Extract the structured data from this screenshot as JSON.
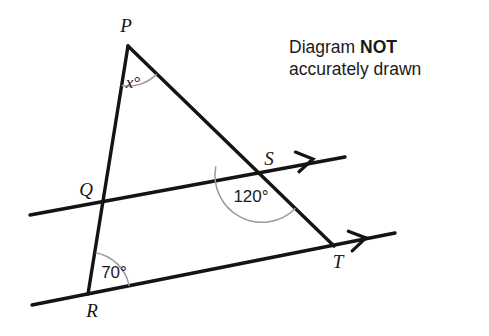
{
  "figure": {
    "type": "geometry-diagram",
    "note": {
      "line1_prefix": "Diagram ",
      "line1_emphasis": "NOT",
      "line2": "accurately drawn"
    },
    "vertices": [
      {
        "id": "P",
        "label": "P",
        "x": 128,
        "y": 46,
        "label_x": 126,
        "label_y": 32
      },
      {
        "id": "Q",
        "label": "Q",
        "x": 101,
        "y": 205,
        "label_x": 86,
        "label_y": 196
      },
      {
        "id": "R",
        "label": "R",
        "x": 88,
        "y": 294,
        "label_x": 92,
        "label_y": 317
      },
      {
        "id": "S",
        "label": "S",
        "x": 262,
        "y": 175,
        "label_x": 269,
        "label_y": 165
      },
      {
        "id": "T",
        "label": "T",
        "x": 334,
        "y": 246,
        "label_x": 338,
        "label_y": 268
      }
    ],
    "segments": [
      {
        "id": "PR",
        "from": "P",
        "to": "R",
        "x1": 128,
        "y1": 46,
        "x2": 88,
        "y2": 294
      },
      {
        "id": "PT",
        "from": "P",
        "to": "T",
        "x1": 128,
        "y1": 46,
        "x2": 334,
        "y2": 246
      },
      {
        "id": "line-through-QS",
        "x1": 30,
        "y1": 215,
        "x2": 345,
        "y2": 157,
        "parallel_mark": "single-arrow"
      },
      {
        "id": "line-through-RT",
        "x1": 32,
        "y1": 305,
        "x2": 395,
        "y2": 233,
        "parallel_mark": "single-arrow"
      }
    ],
    "arrow_marks": [
      {
        "id": "arrow-on-QS",
        "x": 310,
        "y": 159.5,
        "angle_deg": -10.5
      },
      {
        "id": "arrow-on-RT",
        "x": 363,
        "y": 238.5,
        "angle_deg": -11.3
      }
    ],
    "angles": [
      {
        "id": "angle-at-P",
        "vertex": "P",
        "label": "x°",
        "value": "x",
        "unit": "degrees",
        "label_x": 133,
        "label_y": 88,
        "arc_radius": 40,
        "arc_start_deg": 99.2,
        "arc_end_deg": 44.2,
        "label_style": "serif-italic"
      },
      {
        "id": "angle-at-S",
        "vertex": "S",
        "label": "120°",
        "value": 120,
        "unit": "degrees",
        "label_x": 251,
        "label_y": 202,
        "arc_radius": 47,
        "arc_start_deg": 190.5,
        "arc_end_deg": 315.5,
        "label_style": "sans"
      },
      {
        "id": "angle-at-R",
        "vertex": "R",
        "label": "70°",
        "value": 70,
        "unit": "degrees",
        "label_x": 114,
        "label_y": 278,
        "arc_radius": 42,
        "arc_start_deg": 280.8,
        "arc_end_deg": 348.8,
        "label_style": "sans"
      }
    ],
    "colors": {
      "line": "#141414",
      "arc": "#9a9a9a",
      "text": "#1a1a1a",
      "background": "#ffffff"
    }
  }
}
